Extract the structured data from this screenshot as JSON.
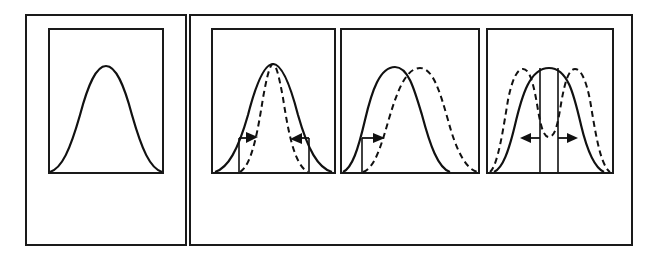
{
  "diagram": {
    "colors": {
      "stroke": "#111111",
      "background": "#ffffff"
    },
    "panels": [
      {
        "id": "baseline",
        "curves": [
          "solid-bell"
        ],
        "arrows": []
      },
      {
        "id": "stabilizing",
        "curves": [
          "solid-bell",
          "dashed-narrow-bell"
        ],
        "arrows": [
          "inward-left",
          "inward-right"
        ]
      },
      {
        "id": "directional",
        "curves": [
          "solid-bell",
          "dashed-shifted-bell"
        ],
        "arrows": [
          "rightward"
        ]
      },
      {
        "id": "disruptive",
        "curves": [
          "solid-bell",
          "dashed-bimodal"
        ],
        "arrows": [
          "outward-left",
          "outward-right"
        ]
      }
    ]
  }
}
